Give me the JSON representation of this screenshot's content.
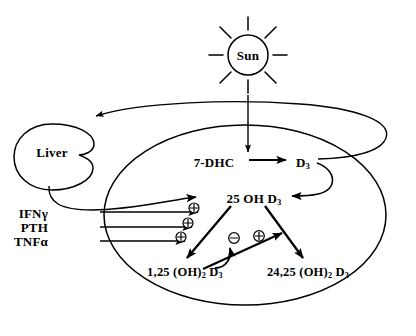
{
  "diagram": {
    "style": {
      "stroke": "#000000",
      "background": "#ffffff",
      "text_color": "#000000"
    },
    "nodes": {
      "sun": {
        "label": "Sun",
        "shape": "sun-with-rays",
        "cx": 248,
        "cy": 55,
        "r": 20
      },
      "liver": {
        "label": "Liver",
        "shape": "organ-blob",
        "cx": 52,
        "cy": 152
      },
      "body": {
        "label": "",
        "shape": "large-ellipse",
        "cx": 245,
        "cy": 215
      },
      "dhc": {
        "label": "7-DHC",
        "x": 214,
        "y": 163
      },
      "d3": {
        "label_main": "D",
        "label_sub": "3",
        "x": 303,
        "y": 163
      },
      "ohd3_25": {
        "label_main": "25 OH D",
        "label_sub": "3",
        "x": 254,
        "y": 199
      },
      "oh2d3_125": {
        "label_main": "1,25 (OH)",
        "label_sub1": "2",
        "label_mid": " D",
        "label_sub2": "3",
        "x": 185,
        "y": 273
      },
      "oh2d3_2425": {
        "label_main": "24,25 (OH)",
        "label_sub1": "2",
        "label_mid": " D",
        "label_sub2": "3",
        "x": 308,
        "y": 273
      }
    },
    "inputs": [
      {
        "label": "IFNγ",
        "x": 75,
        "y": 214,
        "sign": "⊕",
        "sign_x": 194,
        "sign_y": 211
      },
      {
        "label": "PTH",
        "x": 75,
        "y": 228,
        "sign": "⊕",
        "sign_x": 188,
        "sign_y": 226
      },
      {
        "label": "TNFα",
        "x": 75,
        "y": 242,
        "sign": "⊕",
        "sign_x": 181,
        "sign_y": 240
      }
    ],
    "feedback": [
      {
        "sign": "⊖",
        "name": "inhibition-symbol",
        "x": 234,
        "y": 240
      },
      {
        "sign": "⊕",
        "name": "stimulation-symbol",
        "x": 259,
        "y": 238
      }
    ]
  }
}
